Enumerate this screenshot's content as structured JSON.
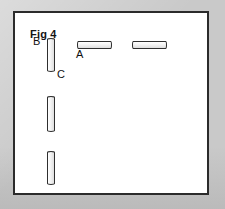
{
  "figure": {
    "title": "Fig 4",
    "panel": {
      "background_color": "#ffffff",
      "border_color": "#2b2b2b",
      "surround_color": "#c9c9c9"
    },
    "labels": [
      {
        "id": "A",
        "text": "A",
        "describes": "horizontal-capsule-left"
      },
      {
        "id": "B",
        "text": "B",
        "describes": "vertical-capsule-top"
      },
      {
        "id": "C",
        "text": "C",
        "describes": "vertical-capsule-top-lower-end"
      }
    ],
    "shapes": [
      {
        "id": "vertical-capsule-top",
        "orientation": "vertical",
        "label": "B"
      },
      {
        "id": "vertical-capsule-middle",
        "orientation": "vertical",
        "label": ""
      },
      {
        "id": "vertical-capsule-bottom",
        "orientation": "vertical",
        "label": ""
      },
      {
        "id": "horizontal-capsule-left",
        "orientation": "horizontal",
        "label": "A"
      },
      {
        "id": "horizontal-capsule-right",
        "orientation": "horizontal",
        "label": ""
      }
    ]
  }
}
